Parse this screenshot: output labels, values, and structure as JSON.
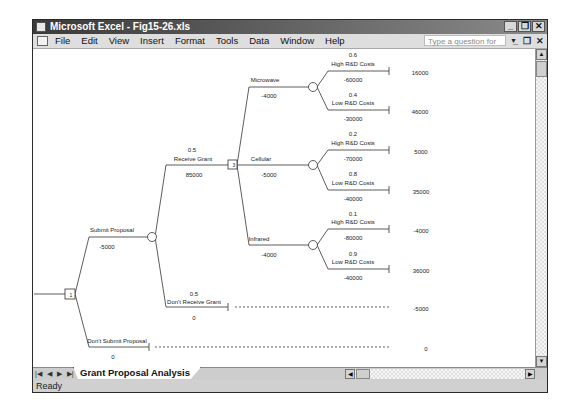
{
  "window": {
    "title": "Microsoft Excel - Fig15-26.xls",
    "buttons": {
      "minimize": "_",
      "restore": "❐",
      "close": "✕"
    }
  },
  "menubar": {
    "items": [
      {
        "label": "File"
      },
      {
        "label": "Edit"
      },
      {
        "label": "View"
      },
      {
        "label": "Insert"
      },
      {
        "label": "Format"
      },
      {
        "label": "Tools"
      },
      {
        "label": "Data"
      },
      {
        "label": "Window"
      },
      {
        "label": "Help"
      }
    ],
    "help_placeholder": "Type a question for help",
    "doc_buttons": {
      "minimize": "_",
      "restore": "❐",
      "close": "✕"
    }
  },
  "sheet_tabs": {
    "nav_icons": [
      "first-sheet-icon",
      "prev-sheet-icon",
      "next-sheet-icon",
      "last-sheet-icon"
    ],
    "active": "Grant Proposal Analysis"
  },
  "status": {
    "text": "Ready"
  },
  "decision_tree": {
    "root": {
      "type": "decision",
      "label": "1"
    },
    "submit_proposal": {
      "label": "Submit Proposal",
      "value": "-5000"
    },
    "dont_submit_proposal": {
      "label": "Don't Submit Proposal",
      "value": "0",
      "payoff": "0"
    },
    "receive_grant": {
      "prob": "0.5",
      "label": "Receive Grant",
      "value": "85000",
      "node_label": "3"
    },
    "dont_receive_grant": {
      "prob": "0.5",
      "label": "Don't Receive Grant",
      "value": "0",
      "payoff": "-5000"
    },
    "alternatives": [
      {
        "label": "Microwave",
        "value": "-4000",
        "outcomes": [
          {
            "prob": "0.6",
            "label": "High R&D Costs",
            "value": "-60000",
            "payoff": "16000"
          },
          {
            "prob": "0.4",
            "label": "Low R&D Costs",
            "value": "-30000",
            "payoff": "46000"
          }
        ]
      },
      {
        "label": "Cellular",
        "value": "-5000",
        "outcomes": [
          {
            "prob": "0.2",
            "label": "High R&D Costs",
            "value": "-70000",
            "payoff": "5000"
          },
          {
            "prob": "0.8",
            "label": "Low R&D Costs",
            "value": "-40000",
            "payoff": "35000"
          }
        ]
      },
      {
        "label": "Infrared",
        "value": "-4000",
        "outcomes": [
          {
            "prob": "0.1",
            "label": "High R&D Costs",
            "value": "-80000",
            "payoff": "-4000"
          },
          {
            "prob": "0.9",
            "label": "Low R&D Costs",
            "value": "-40000",
            "payoff": "36000"
          }
        ]
      }
    ]
  }
}
